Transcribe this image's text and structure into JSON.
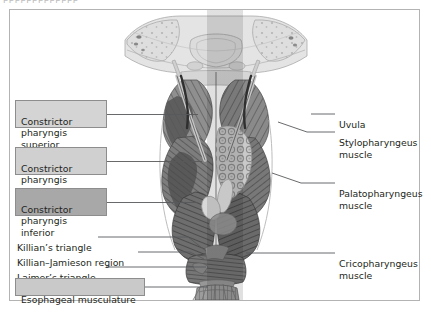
{
  "page": {
    "top_clipped_text": "ppppppppppppp",
    "frame_border_color": "#b3b3b3",
    "background_color": "#ffffff"
  },
  "figure": {
    "illustration_name": "pharynx-posterior-view",
    "shading_band": {
      "description": "vertical midline tonal band",
      "color": "#9a9a9a"
    }
  },
  "left_labels": [
    {
      "id": "constrictor-pharyngis-superior",
      "text": "Constrictor\npharyngis superior",
      "boxed": true,
      "fill": "#d4d4d4",
      "x": 14,
      "y": 99,
      "width": 92,
      "height": 28,
      "leader_to_x": 195,
      "leader_y": 113
    },
    {
      "id": "constrictor-pharyngis-medius",
      "text": "Constrictor\npharyngis medius",
      "boxed": true,
      "fill": "#d0d0d0",
      "x": 14,
      "y": 146,
      "width": 92,
      "height": 28,
      "leader_to_x": 200,
      "leader_y": 160
    },
    {
      "id": "constrictor-pharyngis-inferior",
      "text": "Constrictor\npharyngis inferior",
      "boxed": true,
      "fill": "#a8a8a8",
      "x": 14,
      "y": 187,
      "width": 92,
      "height": 28,
      "leader_to_x": 196,
      "leader_y": 201
    },
    {
      "id": "killians-triangle",
      "text": "Killian’s triangle",
      "boxed": false,
      "x": 16,
      "y": 231,
      "leader_from_x": 96,
      "leader_y": 236,
      "bend_x": 190,
      "target_x": 202,
      "target_y": 250
    },
    {
      "id": "killian-jamieson-region",
      "text": "Killian–Jamieson region",
      "boxed": false,
      "x": 16,
      "y": 246,
      "leader_from_x": 136,
      "leader_y": 251,
      "bend_x": 192,
      "target_x": 201,
      "target_y": 258
    },
    {
      "id": "laimers-triangle",
      "text": "Laimer’s triangle",
      "boxed": false,
      "x": 16,
      "y": 261,
      "leader_from_x": 104,
      "leader_y": 266,
      "bend_x": 199,
      "target_x": 205,
      "target_y": 266
    },
    {
      "id": "esophageal-musculature",
      "text": "Esophageal musculature",
      "boxed": true,
      "fill": "#c9c9c9",
      "x": 14,
      "y": 277,
      "width": 130,
      "height": 17,
      "leader_to_x": 206,
      "leader_y": 286
    }
  ],
  "right_labels": [
    {
      "id": "uvula",
      "text": "Uvula",
      "x": 338,
      "y": 108,
      "leader_from_x": 310,
      "leader_to_x": 334,
      "leader_y": 113,
      "bend_x": 290,
      "target_x": 258,
      "target_y": 113
    },
    {
      "id": "stylopharyngeus-muscle",
      "text": "Stylopharyngeus\nmuscle",
      "x": 338,
      "y": 127,
      "leader_from_x": 306,
      "leader_to_x": 334,
      "leader_y": 131,
      "bend_x": 288,
      "target_x": 262,
      "target_y": 122
    },
    {
      "id": "palatopharyngeus-muscle",
      "text": "Palatopharyngeus\nmuscle",
      "x": 338,
      "y": 178,
      "leader_from_x": 300,
      "leader_to_x": 334,
      "leader_y": 182,
      "bend_x": 292,
      "target_x": 264,
      "target_y": 173
    },
    {
      "id": "cricopharyngeus-muscle",
      "text": "Cricopharyngeus\nmuscle",
      "x": 338,
      "y": 248,
      "leader_from_x": 306,
      "leader_to_x": 334,
      "leader_y": 252,
      "bend_x": 300,
      "target_x": 243,
      "target_y": 252
    }
  ]
}
